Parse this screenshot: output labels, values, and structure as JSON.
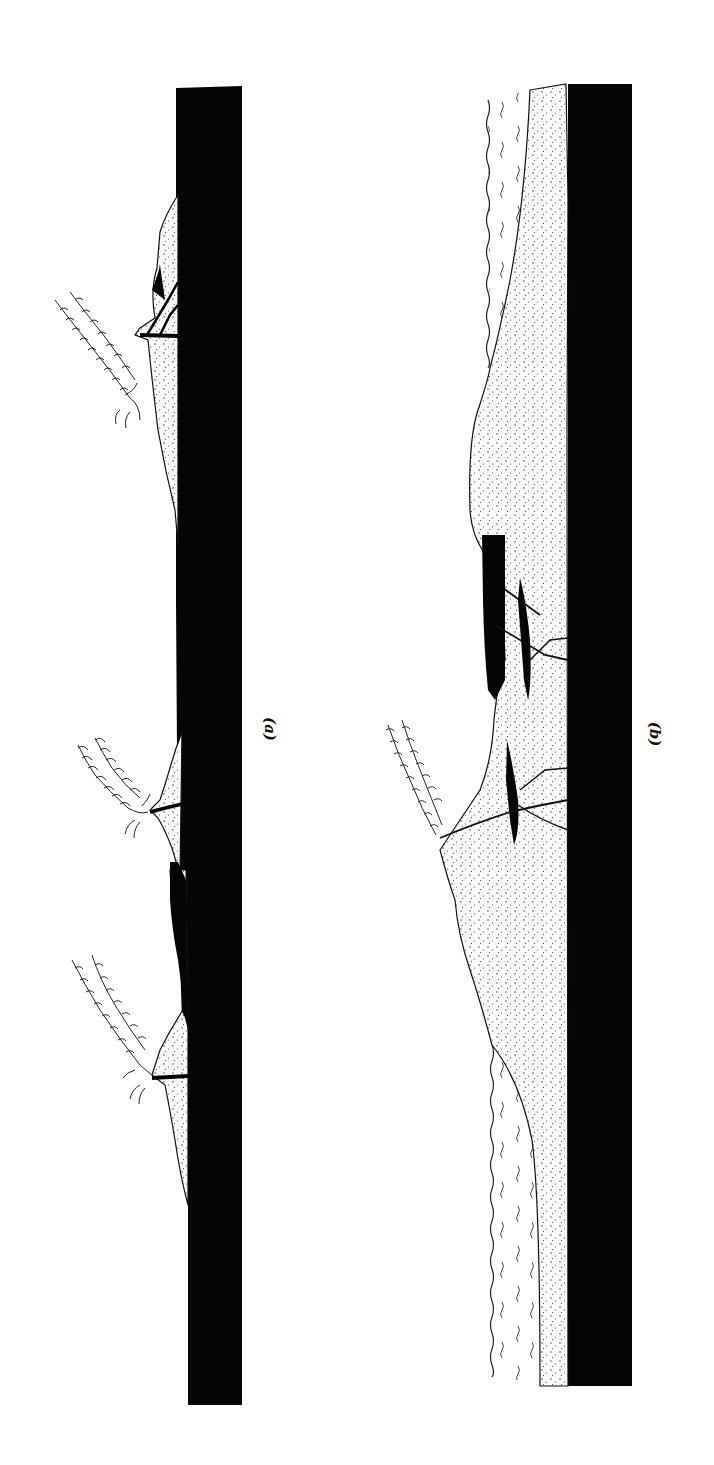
{
  "figure": {
    "orientation": "rotated 90deg clockwise",
    "panels": [
      {
        "id": "a",
        "label": "(a)",
        "description": "Three separate volcanic cones (stippled) built on a dark basement layer, each with an eruption plume",
        "features": [
          "basement-layer",
          "volcanic-cone-1",
          "volcanic-cone-2",
          "volcanic-cone-3",
          "eruption-plume-1",
          "eruption-plume-2",
          "eruption-plume-3",
          "feeder-dykes"
        ]
      },
      {
        "id": "b",
        "label": "(b)",
        "description": "Coalesced volcanic pile (stippled) on dark basement with one eruption plume, intrusions, and water layers on flanks",
        "features": [
          "basement-layer",
          "volcanic-pile",
          "eruption-plume",
          "intrusions",
          "water-layer-upper",
          "water-layer-lower"
        ]
      }
    ]
  },
  "colors": {
    "background": "#ffffff",
    "basement": "#050505",
    "stipple_fill": "#f7f7f7",
    "stipple_dot": "#333333",
    "line": "#111111"
  }
}
